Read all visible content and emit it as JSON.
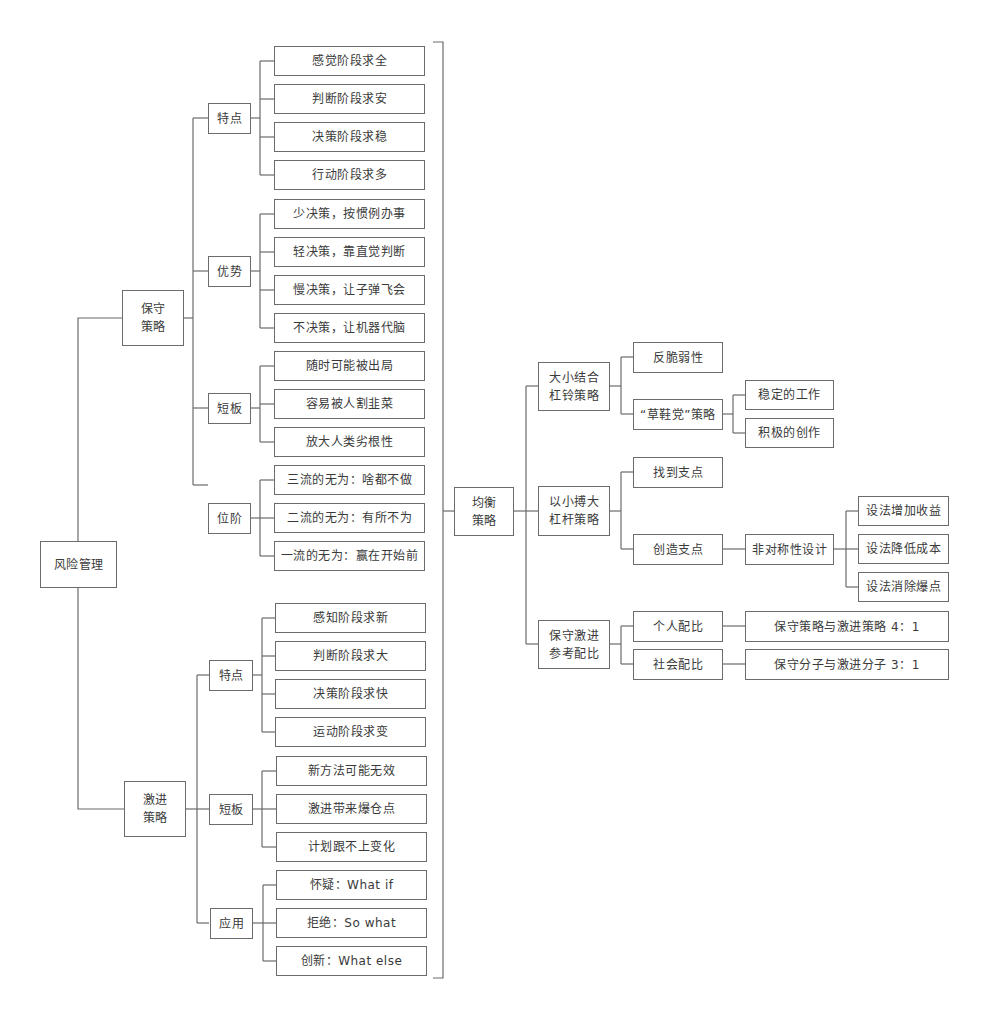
{
  "diagram": {
    "type": "mind-map / tree",
    "root": "风险管理",
    "conservative": {
      "label": "保守\n策略",
      "groups": [
        {
          "label": "特点",
          "items": [
            "感觉阶段求全",
            "判断阶段求安",
            "决策阶段求稳",
            "行动阶段求多"
          ]
        },
        {
          "label": "优势",
          "items": [
            "少决策，按惯例办事",
            "轻决策，靠直觉判断",
            "慢决策，让子弹飞会",
            "不决策，让机器代脑"
          ]
        },
        {
          "label": "短板",
          "items": [
            "随时可能被出局",
            "容易被人割韭菜",
            "放大人类劣根性"
          ]
        },
        {
          "label": "位阶",
          "items": [
            "三流的无为：啥都不做",
            "二流的无为：有所不为",
            "一流的无为：赢在开始前"
          ]
        }
      ]
    },
    "aggressive": {
      "label": "激进\n策略",
      "groups": [
        {
          "label": "特点",
          "items": [
            "感知阶段求新",
            "判断阶段求大",
            "决策阶段求快",
            "运动阶段求变"
          ]
        },
        {
          "label": "短板",
          "items": [
            "新方法可能无效",
            "激进带来爆仓点",
            "计划跟不上变化"
          ]
        },
        {
          "label": "应用",
          "items": [
            "怀疑：What if",
            "拒绝：So what",
            "创新：What else"
          ]
        }
      ]
    },
    "balanced": {
      "label": "均衡\n策略",
      "barbell": {
        "label": "大小结合\n杠铃策略",
        "items": [
          "反脆弱性",
          "“草鞋党”策略"
        ],
        "straw_sandal_children": [
          "稳定的工作",
          "积极的创作"
        ]
      },
      "leverage": {
        "label": "以小搏大\n杠杆策略",
        "items": [
          "找到支点",
          "创造支点"
        ],
        "create_child": "非对称性设计",
        "asymmetric_children": [
          "设法增加收益",
          "设法降低成本",
          "设法消除爆点"
        ]
      },
      "ratio": {
        "label": "保守激进\n参考配比",
        "items": [
          {
            "label": "个人配比",
            "value": "保守策略与激进策略 4：1"
          },
          {
            "label": "社会配比",
            "value": "保守分子与激进分子 3：1"
          }
        ]
      }
    },
    "colors": {
      "line": "#6b6b6b",
      "text": "#3a3a3a",
      "background": "#ffffff"
    }
  }
}
